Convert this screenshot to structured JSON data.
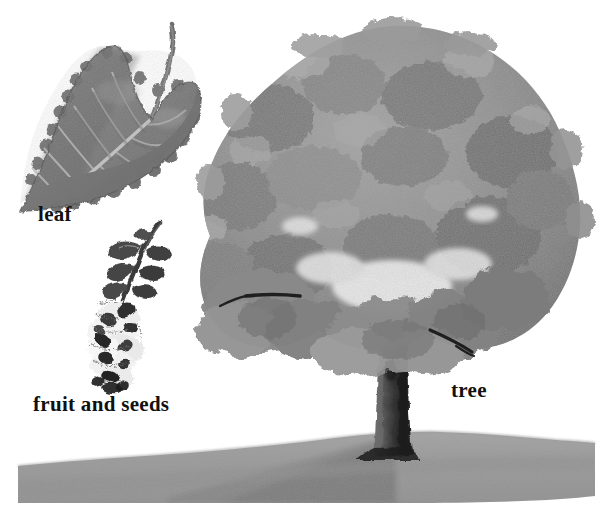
{
  "plate": {
    "title": "Cottonwood botanical plate",
    "background_color": "#ffffff",
    "width": 604,
    "height": 519,
    "medium": "grayscale watercolor / wash illustration"
  },
  "labels": {
    "leaf": "leaf",
    "fruit_and_seeds": "fruit and seeds",
    "tree": "tree"
  },
  "palette": {
    "paper": "#ffffff",
    "canopy_light": "#a8a8a8",
    "canopy_mid": "#8d8d8d",
    "canopy_dark": "#6f6f6f",
    "canopy_deep": "#5a5a5a",
    "branch": "#1d1d1d",
    "trunk_light": "#6a6a6a",
    "trunk_dark": "#262626",
    "ground": "#9a9a9a",
    "ground_shadow": "#7d7d7d",
    "leaf_body": "#7e7e7e",
    "leaf_dark": "#606060",
    "leaf_vein": "#c9c9c9",
    "seed_fluff": "#efefef",
    "seed_dark": "#2a2a2a",
    "text": "#111111"
  },
  "figures": {
    "leaf": {
      "name": "leaf",
      "description": "Heart-shaped cottonwood leaf with serrated margin, pale midrib and lateral veins, long curving petiole to the upper right",
      "bbox": [
        14,
        22,
        206,
        212
      ]
    },
    "fruit_and_seeds": {
      "name": "fruit and seeds",
      "description": "Drooping catkin: dark curved stalk with small alternating leaflets above, fluffy white cottony seed capsules with dark speckles below",
      "bbox": [
        88,
        218,
        180,
        392
      ]
    },
    "tree": {
      "name": "tree",
      "description": "Broad rounded deciduous tree, mottled gray canopy, dark radiating branches, thick dark trunk on a gray hill with cast shadow to the left",
      "bbox": [
        205,
        25,
        595,
        505
      ]
    },
    "ground": {
      "name": "ground",
      "description": "Low gray mound of ground rising toward the right under the tree with shadow",
      "bbox": [
        18,
        432,
        595,
        503
      ]
    }
  }
}
